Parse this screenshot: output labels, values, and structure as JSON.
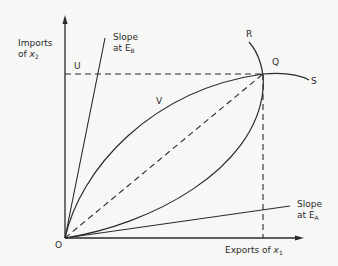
{
  "diagram": {
    "type": "offer-curve trade diagram",
    "axes": {
      "y_label_line1": "Imports",
      "y_label_line2_prefix": "of ",
      "y_label_var": "x",
      "y_label_sub": "2",
      "x_label_prefix": "Exports of ",
      "x_label_var": "x",
      "x_label_sub": "1"
    },
    "points": {
      "origin": "O",
      "equilibrium": "Q",
      "upper_curve_end": "R",
      "right_curve_end": "S",
      "point_u": "U",
      "point_v": "V"
    },
    "slope_labels": {
      "eb_line1": "Slope",
      "eb_line2_prefix": "at E",
      "eb_sub": "B",
      "ea_line1": "Slope",
      "ea_line2_prefix": "at E",
      "ea_sub": "A"
    },
    "colors": {
      "ink": "#2a2a2a",
      "background": "#f7f7f5"
    }
  }
}
